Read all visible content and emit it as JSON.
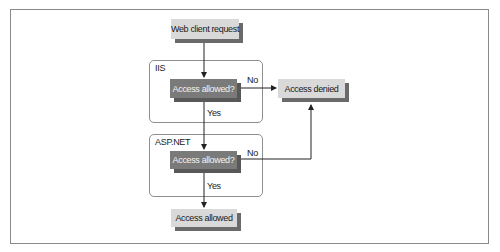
{
  "diagram": {
    "type": "flowchart",
    "nodes": {
      "start": {
        "label": "Web client request",
        "style": "light"
      },
      "iis_check": {
        "label": "Access allowed?",
        "style": "dark"
      },
      "denied": {
        "label": "Access denied",
        "style": "light"
      },
      "aspnet_check": {
        "label": "Access allowed?",
        "style": "dark"
      },
      "allowed": {
        "label": "Access allowed",
        "style": "light"
      }
    },
    "groups": {
      "iis": {
        "label": "IIS"
      },
      "aspnet": {
        "label": "ASP.NET"
      }
    },
    "edges": [
      {
        "from": "start",
        "to": "iis_check",
        "label": ""
      },
      {
        "from": "iis_check",
        "to": "denied",
        "label": "No"
      },
      {
        "from": "iis_check",
        "to": "aspnet_check",
        "label": "Yes"
      },
      {
        "from": "aspnet_check",
        "to": "denied",
        "label": "No"
      },
      {
        "from": "aspnet_check",
        "to": "allowed",
        "label": "Yes"
      }
    ],
    "edge_labels": {
      "iis_no": "No",
      "iis_yes": "Yes",
      "aspnet_no": "No",
      "aspnet_yes": "Yes"
    },
    "colors": {
      "light_box": "#d9d9d9",
      "dark_box": "#7a7a7a",
      "shadow": "#6a6a6a",
      "line": "#222222",
      "frame": "#8a8a8a"
    }
  }
}
